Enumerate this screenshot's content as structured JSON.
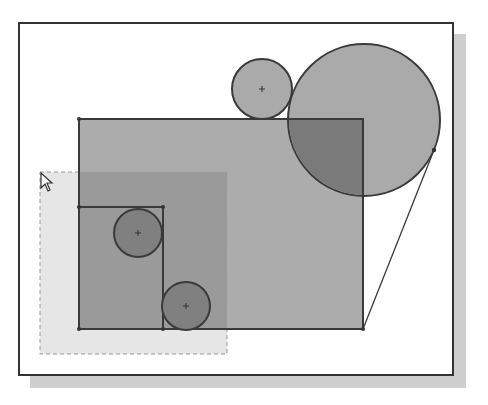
{
  "window": {
    "frame": {
      "x": 18,
      "y": 22,
      "width": 436,
      "height": 354
    },
    "shadow_offset": 12
  },
  "colors": {
    "background": "#ffffff",
    "frame_border": "#333333",
    "shadow": "#cfcfcf",
    "region_fill": "#a8a8a8",
    "overlap_fill": "#7a7a7a",
    "small_circle_fill": "#808080",
    "outline": "#3a3a3a",
    "selection_fill": "#e6e6e6",
    "selection_border": "#999999"
  },
  "sketch": {
    "main_rectangle": {
      "x1": 79,
      "y1": 119,
      "x2": 363,
      "y2": 329
    },
    "inner_rectangle": {
      "x1": 79,
      "y1": 207,
      "x2": 163,
      "y2": 329
    },
    "circles": [
      {
        "id": "top-small",
        "cx": 262,
        "cy": 89,
        "r": 30
      },
      {
        "id": "top-large",
        "cx": 364,
        "cy": 120,
        "r": 76
      },
      {
        "id": "inner-upper",
        "cx": 138,
        "cy": 233,
        "r": 24
      },
      {
        "id": "inner-lower",
        "cx": 186,
        "cy": 306,
        "r": 24
      }
    ],
    "tangent_line": {
      "x1": 434,
      "y1": 150,
      "x2": 363,
      "y2": 329
    },
    "selection_window": {
      "x1": 40,
      "y1": 172,
      "x2": 227,
      "y2": 354
    }
  },
  "cursor": {
    "icon": "arrow-pointer-icon",
    "x": 40,
    "y": 172
  }
}
